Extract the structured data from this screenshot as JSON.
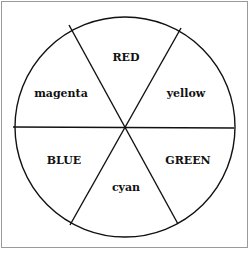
{
  "diagram": {
    "type": "color-wheel",
    "segments": [
      {
        "label": "RED",
        "x": 126,
        "y": 57
      },
      {
        "label": "yellow",
        "x": 186,
        "y": 93
      },
      {
        "label": "GREEN",
        "x": 188,
        "y": 160
      },
      {
        "label": "cyan",
        "x": 126,
        "y": 187
      },
      {
        "label": "BLUE",
        "x": 64,
        "y": 160
      },
      {
        "label": "magenta",
        "x": 61,
        "y": 93
      }
    ]
  }
}
